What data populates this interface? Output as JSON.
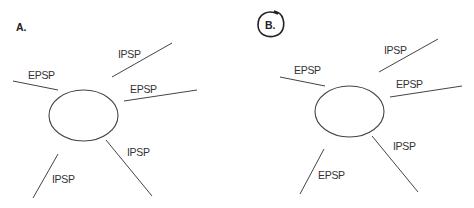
{
  "panels": [
    {
      "label": "A.",
      "circled": false,
      "cell": {
        "cx": 83.5,
        "cy": 115.5,
        "rx": 34.5,
        "ry": 25.5
      },
      "inputs": [
        {
          "position": "upper-left",
          "label": "EPSP",
          "line": [
            13,
            81,
            58,
            90
          ],
          "text_xy": [
            28,
            79
          ]
        },
        {
          "position": "upper",
          "label": "IPSP",
          "line": [
            112,
            77,
            172,
            43
          ],
          "text_xy": [
            118,
            58
          ]
        },
        {
          "position": "right",
          "label": "EPSP",
          "line": [
            124,
            101,
            197,
            90
          ],
          "text_xy": [
            130,
            93
          ]
        },
        {
          "position": "lower-right",
          "label": "IPSP",
          "line": [
            106,
            140,
            152,
            196
          ],
          "text_xy": [
            127,
            156
          ]
        },
        {
          "position": "lower-left",
          "label": "IPSP",
          "line": [
            58,
            154,
            33,
            198
          ],
          "text_xy": [
            52,
            183
          ]
        }
      ]
    },
    {
      "label": "B.",
      "circled": true,
      "cell": {
        "cx": 349.5,
        "cy": 111.5,
        "rx": 34.5,
        "ry": 25.5
      },
      "inputs": [
        {
          "position": "upper-left",
          "label": "EPSP",
          "line": [
            280,
            77,
            325,
            86
          ],
          "text_xy": [
            294,
            74
          ]
        },
        {
          "position": "upper",
          "label": "IPSP",
          "line": [
            379,
            72,
            438,
            39
          ],
          "text_xy": [
            384,
            54
          ]
        },
        {
          "position": "right",
          "label": "EPSP",
          "line": [
            390,
            97,
            462,
            86
          ],
          "text_xy": [
            396,
            88
          ]
        },
        {
          "position": "lower-right",
          "label": "IPSP",
          "line": [
            372,
            136,
            418,
            192
          ],
          "text_xy": [
            393,
            150
          ]
        },
        {
          "position": "lower-left",
          "label": "EPSP",
          "line": [
            324,
            149,
            300,
            194
          ],
          "text_xy": [
            318,
            179
          ]
        }
      ]
    }
  ]
}
